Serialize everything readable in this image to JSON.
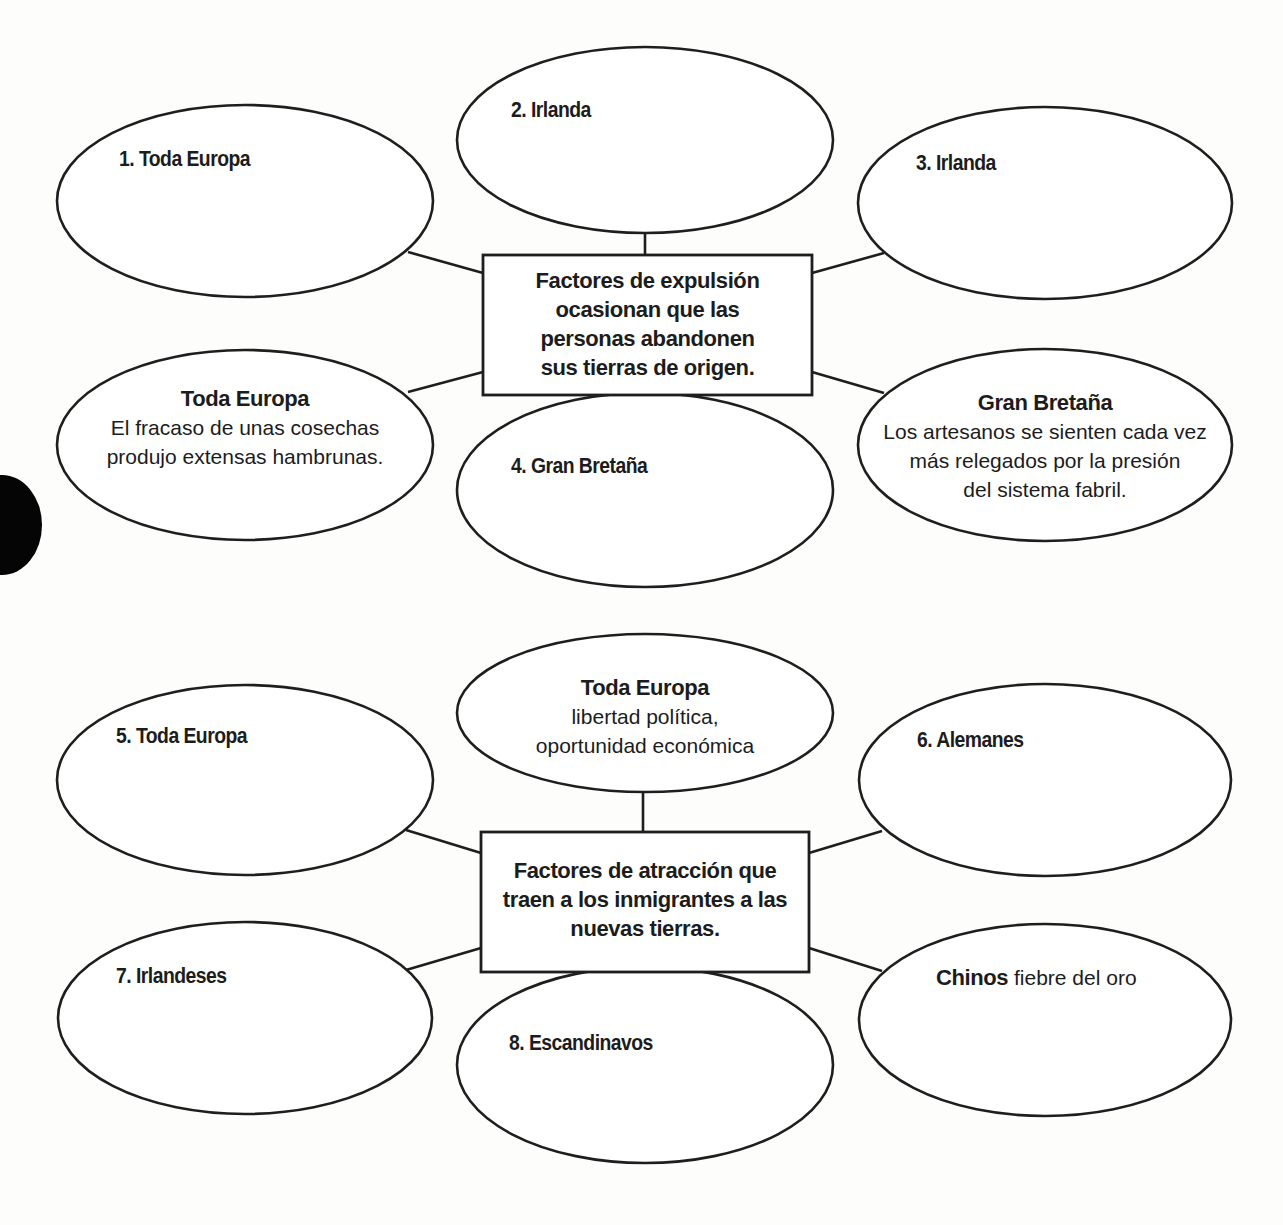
{
  "colors": {
    "stroke": "#1e1e1e",
    "text": "#1c1c1c",
    "background": "#fdfdfb"
  },
  "push_factors": {
    "center": {
      "lines": [
        "Factores de expulsión",
        "ocasionan que las",
        "personas abandonen",
        "sus tierras de origen."
      ]
    },
    "nodes": [
      {
        "id": "1",
        "label": "1. Toda Europa",
        "answer": ""
      },
      {
        "id": "2",
        "label": "2. Irlanda",
        "answer": ""
      },
      {
        "id": "3",
        "label": "3. Irlanda",
        "answer": ""
      },
      {
        "id": "example-left",
        "heading": "Toda Europa",
        "lines": [
          "El fracaso de unas cosechas",
          "produjo extensas hambrunas."
        ]
      },
      {
        "id": "4",
        "label": "4. Gran Bretaña",
        "answer": ""
      },
      {
        "id": "example-right",
        "heading": "Gran Bretaña",
        "lines": [
          "Los artesanos se sienten cada vez",
          "más relegados por la presión",
          "del sistema fabril."
        ]
      }
    ]
  },
  "pull_factors": {
    "center": {
      "lines": [
        "Factores de atracción que",
        "traen a los inmigrantes a las",
        "nuevas tierras."
      ]
    },
    "nodes": [
      {
        "id": "5",
        "label": "5. Toda Europa",
        "answer": ""
      },
      {
        "id": "example-top",
        "heading": "Toda Europa",
        "lines": [
          "libertad política,",
          "oportunidad económica"
        ]
      },
      {
        "id": "6",
        "label": "6. Alemanes",
        "answer": ""
      },
      {
        "id": "7",
        "label": "7. Irlandeses",
        "answer": ""
      },
      {
        "id": "8",
        "label": "8. Escandinavos",
        "answer": ""
      },
      {
        "id": "example-right",
        "heading": "Chinos",
        "text": "fiebre del oro"
      }
    ]
  }
}
